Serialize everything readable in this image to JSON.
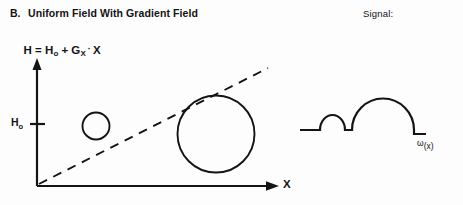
{
  "figure": {
    "background_color": "#fdfdfd",
    "ink_color": "#141414",
    "section": {
      "letter": "B.",
      "name": "Uniform Field With Gradient Field"
    },
    "equation": {
      "full_text": "H = Ho + GX · X",
      "lhs": "H",
      "equals": "=",
      "term_uniform": "H",
      "term_uniform_sub": "o",
      "plus": "+",
      "term_gradient": "G",
      "term_gradient_sub": "X",
      "dot_operator": "·",
      "variable": "X"
    },
    "left_plot": {
      "y_axis_tick_label": "H",
      "y_axis_tick_label_sub": "o",
      "x_axis_label": "X",
      "gradient_line_style": "dashed",
      "sample_circles": [
        {
          "name": "small-sample-circle",
          "cx": 96,
          "cy": 126,
          "r": 13.5
        },
        {
          "name": "large-sample-circle",
          "cx": 216,
          "cy": 134,
          "r": 38.5
        }
      ],
      "axes": {
        "origin_x": 37,
        "origin_y": 186,
        "y_axis_top": 60,
        "x_axis_right": 277,
        "h0_tick_y": 124
      },
      "gradient_line": {
        "x1": 39,
        "y1": 184,
        "x2": 268,
        "y2": 68
      }
    },
    "right_plot": {
      "title": "Signal:",
      "x_axis_label_symbol": "ω",
      "x_axis_label_arg": "(x)",
      "waveform": {
        "baseline_y": 130,
        "start_x": 300,
        "end_x": 425,
        "small_bump": {
          "left_x": 320,
          "right_x": 345,
          "peak_y": 114,
          "radius": 12.5
        },
        "flat_gap": {
          "left_x": 345,
          "right_x": 352
        },
        "large_bump": {
          "left_x": 352,
          "right_x": 414,
          "peak_y": 99,
          "radius": 31
        },
        "end_tick": {
          "x": 414,
          "top_y": 130,
          "bottom_y": 134
        }
      }
    }
  }
}
